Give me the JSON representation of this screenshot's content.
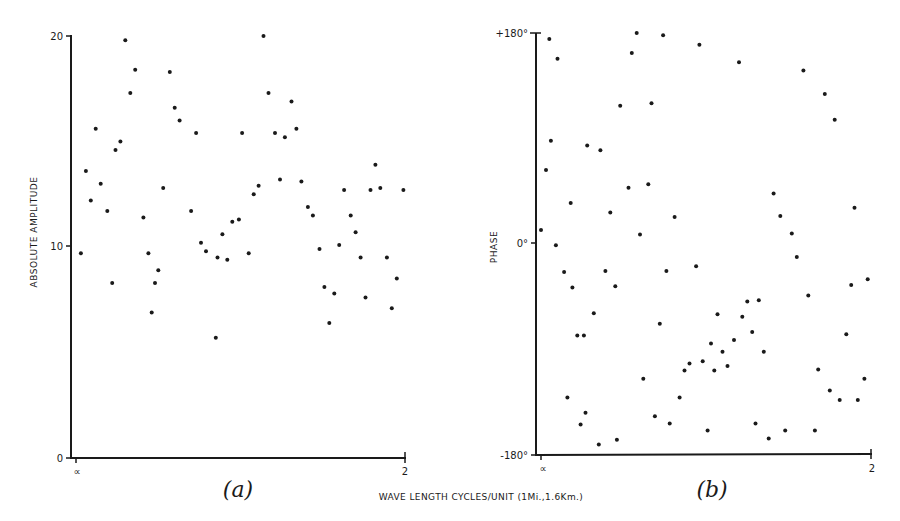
{
  "figure": {
    "xlabel": "WAVE LENGTH CYCLES/UNIT (1Mi.,1.6Km.)"
  },
  "chart_data": [
    {
      "type": "scatter",
      "panel": "(a)",
      "title": "",
      "xlabel": "WAVE LENGTH CYCLES/UNIT (1Mi.,1.6Km.)",
      "ylabel": "ABSOLUTE AMPLITUDE",
      "x_tick_labels": [
        "∝",
        "2"
      ],
      "y_tick_labels": [
        "0",
        "10",
        "20"
      ],
      "xlim": [
        0,
        2
      ],
      "ylim": [
        0,
        20
      ],
      "grid": false,
      "legend": null,
      "x": [
        0.03,
        0.06,
        0.09,
        0.12,
        0.15,
        0.19,
        0.22,
        0.24,
        0.27,
        0.3,
        0.33,
        0.36,
        0.41,
        0.44,
        0.46,
        0.48,
        0.5,
        0.53,
        0.57,
        0.6,
        0.63,
        0.7,
        0.73,
        0.76,
        0.79,
        0.85,
        0.86,
        0.89,
        0.92,
        0.95,
        0.99,
        1.01,
        1.05,
        1.08,
        1.11,
        1.14,
        1.17,
        1.21,
        1.24,
        1.27,
        1.31,
        1.34,
        1.37,
        1.41,
        1.44,
        1.48,
        1.51,
        1.54,
        1.57,
        1.6,
        1.63,
        1.67,
        1.7,
        1.73,
        1.76,
        1.79,
        1.82,
        1.85,
        1.89,
        1.92,
        1.95,
        1.99
      ],
      "values": [
        9.7,
        13.6,
        12.2,
        15.6,
        13.0,
        11.7,
        8.3,
        14.6,
        15.0,
        19.8,
        17.3,
        18.4,
        11.4,
        9.7,
        6.9,
        8.3,
        8.9,
        12.8,
        18.3,
        16.6,
        16.0,
        11.7,
        15.4,
        10.2,
        9.8,
        5.7,
        9.5,
        10.6,
        9.4,
        11.2,
        11.3,
        15.4,
        9.7,
        12.5,
        12.9,
        20.0,
        17.3,
        15.4,
        13.2,
        15.2,
        16.9,
        15.6,
        13.1,
        11.9,
        11.5,
        9.9,
        8.1,
        6.4,
        7.8,
        10.1,
        12.7,
        11.5,
        10.7,
        9.5,
        7.6,
        12.7,
        13.9,
        12.8,
        9.5,
        7.1,
        8.5,
        12.7
      ]
    },
    {
      "type": "scatter",
      "panel": "(b)",
      "title": "",
      "xlabel": "WAVE LENGTH CYCLES/UNIT (1Mi.,1.6Km.)",
      "ylabel": "PHASE",
      "x_tick_labels": [
        "∝",
        "2"
      ],
      "y_tick_labels": [
        "-180°",
        "0°",
        "+180°"
      ],
      "xlim": [
        0,
        2
      ],
      "ylim": [
        -180,
        180
      ],
      "grid": false,
      "legend": null,
      "x": [
        0.0,
        0.03,
        0.05,
        0.06,
        0.09,
        0.1,
        0.14,
        0.16,
        0.18,
        0.19,
        0.22,
        0.24,
        0.26,
        0.27,
        0.28,
        0.32,
        0.35,
        0.36,
        0.39,
        0.42,
        0.45,
        0.46,
        0.48,
        0.53,
        0.55,
        0.58,
        0.6,
        0.62,
        0.65,
        0.67,
        0.69,
        0.72,
        0.74,
        0.76,
        0.78,
        0.81,
        0.84,
        0.87,
        0.9,
        0.94,
        0.96,
        0.98,
        1.01,
        1.03,
        1.05,
        1.07,
        1.1,
        1.13,
        1.17,
        1.2,
        1.22,
        1.25,
        1.28,
        1.3,
        1.32,
        1.35,
        1.38,
        1.41,
        1.45,
        1.48,
        1.52,
        1.55,
        1.59,
        1.62,
        1.66,
        1.68,
        1.72,
        1.75,
        1.78,
        1.81,
        1.85,
        1.88,
        1.9,
        1.92,
        1.96,
        1.98
      ],
      "values": [
        12,
        63,
        175,
        88,
        -1,
        158,
        -24,
        -131,
        35,
        -37,
        -78,
        -154,
        -78,
        -144,
        84,
        -59,
        -171,
        80,
        -23,
        27,
        -36,
        -167,
        118,
        48,
        163,
        180,
        8,
        -115,
        51,
        120,
        -147,
        -68,
        178,
        -23,
        -153,
        23,
        -131,
        -108,
        -102,
        -19,
        170,
        -100,
        -159,
        -85,
        -108,
        -60,
        -92,
        -104,
        -82,
        155,
        -62,
        -49,
        -75,
        -153,
        -48,
        -92,
        -166,
        43,
        24,
        -159,
        9,
        -11,
        148,
        -44,
        -159,
        -107,
        128,
        -125,
        106,
        -133,
        -77,
        -35,
        31,
        -133,
        -115,
        -30
      ]
    }
  ]
}
